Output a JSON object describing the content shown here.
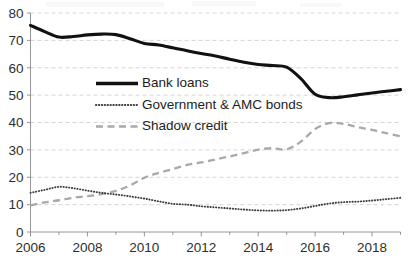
{
  "chart_data": {
    "type": "line",
    "title": "",
    "subtitle": "",
    "xlabel": "",
    "ylabel": "",
    "xlim": [
      2006,
      2019
    ],
    "ylim": [
      0,
      80
    ],
    "y_ticks": [
      0,
      10,
      20,
      30,
      40,
      50,
      60,
      70,
      80
    ],
    "x_ticks": [
      2006,
      2008,
      2010,
      2012,
      2014,
      2016,
      2018
    ],
    "x_tick_labels": [
      "2006",
      "2008",
      "2010",
      "2012",
      "2014",
      "2016",
      "2018"
    ],
    "y_tick_labels": [
      "0",
      "10",
      "20",
      "30",
      "40",
      "50",
      "60",
      "70",
      "80"
    ],
    "x_minor_tick_interval": 1,
    "grid": true,
    "grid_axis": "y",
    "grid_style": "dashed",
    "grid_color": "#c9c9c9",
    "legend_position": "inside-upper-center",
    "x": [
      2006,
      2006.5,
      2007,
      2007.5,
      2008,
      2008.5,
      2009,
      2009.5,
      2010,
      2010.5,
      2011,
      2011.5,
      2012,
      2012.5,
      2013,
      2013.5,
      2014,
      2014.5,
      2015,
      2015.5,
      2016,
      2016.5,
      2017,
      2017.5,
      2018,
      2018.5,
      2019
    ],
    "series": [
      {
        "name": "Bank loans",
        "style": "solid",
        "color": "#111111",
        "line_width": 3.1,
        "values": [
          75.5,
          73.2,
          71.2,
          71.4,
          72.0,
          72.3,
          72.1,
          70.6,
          68.9,
          68.3,
          67.3,
          66.2,
          65.2,
          64.3,
          63.1,
          62.0,
          61.2,
          60.8,
          60.2,
          56.0,
          50.3,
          49.1,
          49.4,
          50.1,
          50.8,
          51.4,
          52.0
        ]
      },
      {
        "name": "Government & AMC bonds",
        "style": "dotted",
        "color": "#3c3c3c",
        "line_width": 1.9,
        "values": [
          14.3,
          15.4,
          16.5,
          16.0,
          15.1,
          14.3,
          13.7,
          13.0,
          12.2,
          11.2,
          10.3,
          10.0,
          9.4,
          9.0,
          8.6,
          8.2,
          7.9,
          7.8,
          8.0,
          8.6,
          9.5,
          10.4,
          10.9,
          11.1,
          11.5,
          12.0,
          12.5
        ]
      },
      {
        "name": "Shadow credit",
        "style": "dashed",
        "color": "#a9a9a9",
        "line_width": 2.3,
        "values": [
          9.7,
          10.8,
          11.6,
          12.5,
          13.1,
          13.8,
          15.0,
          17.0,
          19.8,
          21.6,
          23.0,
          24.5,
          25.4,
          26.5,
          27.6,
          28.8,
          30.1,
          30.6,
          30.2,
          33.0,
          37.6,
          39.8,
          39.5,
          38.3,
          37.3,
          36.1,
          35.0
        ]
      }
    ]
  },
  "legend": {
    "items": [
      {
        "label": "Bank loans",
        "style": "solid"
      },
      {
        "label": "Government & AMC bonds",
        "style": "dotted"
      },
      {
        "label": "Shadow credit",
        "style": "dashed"
      }
    ]
  }
}
